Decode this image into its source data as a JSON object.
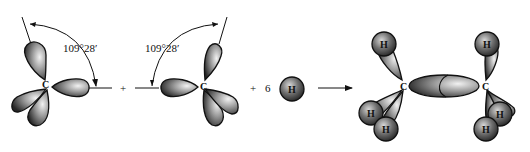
{
  "diagram": {
    "left_carbon": {
      "atom_label": "C",
      "angle_label": "109°28′"
    },
    "right_carbon": {
      "atom_label": "C",
      "angle_label": "109°28′"
    },
    "operators": {
      "plus_1": "+",
      "plus_2": "+",
      "coefficient": "6"
    },
    "hydrogen_reactant": {
      "atom_label": "H"
    },
    "arrow": "→",
    "product": {
      "carbon_labels": [
        "C",
        "C"
      ],
      "hydrogen_labels": [
        "H",
        "H",
        "H",
        "H",
        "H",
        "H"
      ]
    }
  },
  "colors": {
    "lobe_dark": "#2a2a2a",
    "lobe_light": "#e8e8e8",
    "outline": "#111111",
    "background": "#ffffff"
  }
}
